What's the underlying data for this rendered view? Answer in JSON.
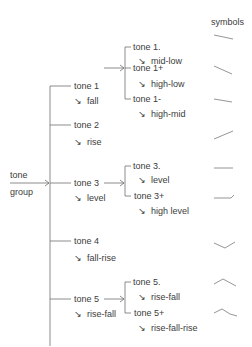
{
  "diagram": {
    "root": {
      "line1": "tone",
      "line2": "group"
    },
    "header": {
      "symbols": "symbols"
    },
    "arrow_glyph": "↘",
    "tones": [
      {
        "name": "tone 1",
        "contour": "fall",
        "subtypes": [
          {
            "name": "tone 1.",
            "contour": "mid-low",
            "symbol": "fall-mid-low"
          },
          {
            "name": "tone 1+",
            "contour": "high-low",
            "symbol": "fall-high-low"
          },
          {
            "name": "tone 1-",
            "contour": "high-mid",
            "symbol": "fall-high-mid"
          }
        ]
      },
      {
        "name": "tone 2",
        "contour": "rise",
        "symbol": "rise"
      },
      {
        "name": "tone 3",
        "contour": "level",
        "subtypes": [
          {
            "name": "tone 3.",
            "contour": "level",
            "symbol": "level"
          },
          {
            "name": "tone 3+",
            "contour": "high level",
            "symbol": "level-high"
          }
        ]
      },
      {
        "name": "tone 4",
        "contour": "fall-rise",
        "symbol": "fall-rise"
      },
      {
        "name": "tone 5",
        "contour": "rise-fall",
        "subtypes": [
          {
            "name": "tone 5.",
            "contour": "rise-fall",
            "symbol": "rise-fall"
          },
          {
            "name": "tone 5+",
            "contour": "rise-fall-rise",
            "symbol": "rise-fall-rise"
          }
        ]
      }
    ],
    "colors": {
      "line": "#6e6e6e",
      "text": "#3c3c3c",
      "symbol": "#7a7a7a"
    }
  }
}
